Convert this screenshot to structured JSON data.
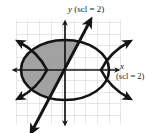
{
  "figure": {
    "kind": "coordinate-graph",
    "background_color": "#ffffff",
    "ink_color": "#141414",
    "grid_color": "#d9d9d9",
    "shade_color": "#9a9a9a",
    "axes": {
      "y_label_variable": "y",
      "y_label_scale": "(scl = 2)",
      "x_label_variable": "x",
      "x_label_scale": "(scl = 2)",
      "origin_px": [
        65,
        70
      ],
      "grid_spacing_px": 11.6,
      "grid_left_px": 16,
      "grid_right_px": 122,
      "grid_top_px": 20,
      "grid_bottom_px": 124
    },
    "curves": [
      {
        "name": "ellipse",
        "type": "ellipse",
        "center_px": [
          65,
          70
        ],
        "radius_x_px": 44,
        "radius_y_px": 30,
        "stroke_width": 2.6
      },
      {
        "name": "hyperbola-left-branch",
        "type": "hyperbola",
        "opens": "left",
        "vertex_px": [
          47,
          70
        ],
        "stroke_width": 2.6,
        "arrowheads": 2
      },
      {
        "name": "hyperbola-right-branch",
        "type": "hyperbola",
        "opens": "right",
        "vertex_px": [
          101,
          70
        ],
        "stroke_width": 2.6,
        "arrowheads": 2
      },
      {
        "name": "diagonal-line",
        "type": "line",
        "from_px": [
          33,
          130
        ],
        "to_px": [
          90,
          20
        ],
        "stroke_width": 2.8,
        "arrowheads": 2
      }
    ],
    "shaded_region": {
      "name": "solution-region",
      "description": "region inside the ellipse, left of the diagonal line, above and left of center",
      "fill": "#9a9a9a",
      "opacity": 0.85
    }
  }
}
